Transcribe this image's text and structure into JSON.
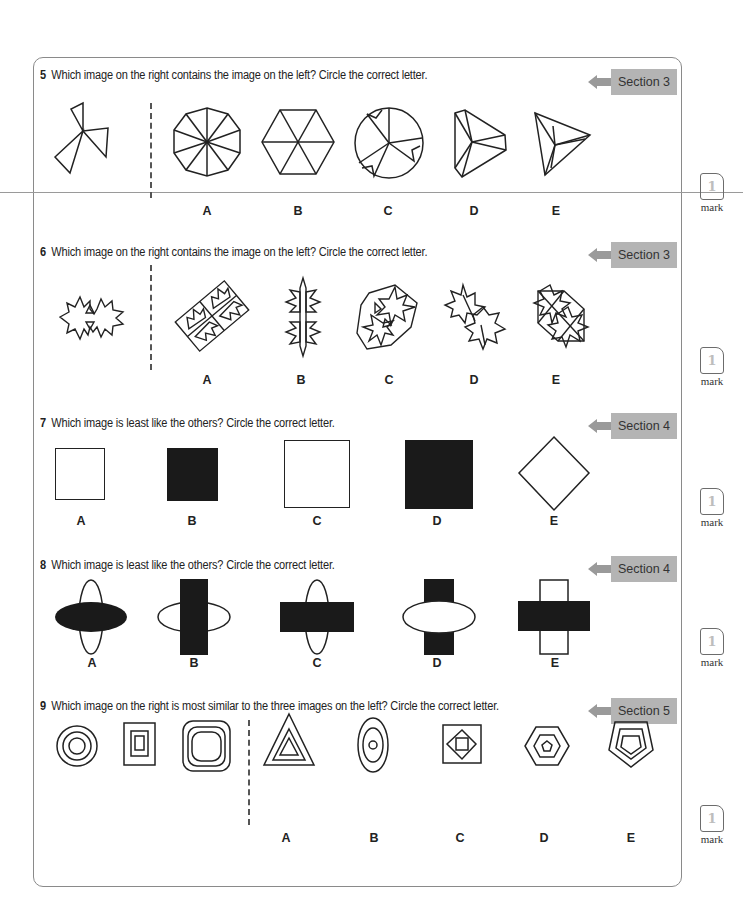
{
  "questions": [
    {
      "number": "5",
      "text": "Which image on the right contains the image on the left? Circle the correct letter.",
      "section": "Section 3",
      "options": [
        "A",
        "B",
        "C",
        "D",
        "E"
      ],
      "mark": "1",
      "mark_label": "mark"
    },
    {
      "number": "6",
      "text": "Which image on the right contains the image on the left? Circle the correct letter.",
      "section": "Section 3",
      "options": [
        "A",
        "B",
        "C",
        "D",
        "E"
      ],
      "mark": "1",
      "mark_label": "mark"
    },
    {
      "number": "7",
      "text": "Which image is least like the others? Circle the correct letter.",
      "section": "Section 4",
      "options": [
        "A",
        "B",
        "C",
        "D",
        "E"
      ],
      "mark": "1",
      "mark_label": "mark"
    },
    {
      "number": "8",
      "text": "Which image is least like the others? Circle the correct letter.",
      "section": "Section 4",
      "options": [
        "A",
        "B",
        "C",
        "D",
        "E"
      ],
      "mark": "1",
      "mark_label": "mark"
    },
    {
      "number": "9",
      "text": "Which image on the right is most similar to the three images on the left? Circle the correct letter.",
      "section": "Section 5",
      "options": [
        "A",
        "B",
        "C",
        "D",
        "E"
      ],
      "mark": "1",
      "mark_label": "mark"
    }
  ],
  "colors": {
    "section_badge": "#b4b4b4",
    "section_arrow": "#9a9a9a",
    "border": "#8a8a8a",
    "shape_fill": "#1a1a1a"
  }
}
